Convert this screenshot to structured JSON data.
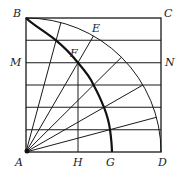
{
  "diagram": {
    "labels": {
      "A": "A",
      "B": "B",
      "C": "C",
      "D": "D",
      "E": "E",
      "F": "F",
      "G": "G",
      "H": "H",
      "M": "M",
      "N": "N"
    },
    "square": {
      "x": 26,
      "y": 18,
      "side": 135
    },
    "divisions": 6,
    "colors": {
      "line": "#1a1a1a",
      "background": "#ffffff"
    }
  }
}
